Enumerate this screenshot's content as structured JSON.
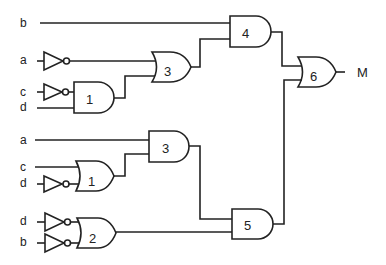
{
  "diagram": {
    "type": "logic-circuit",
    "inputs": [
      {
        "id": "in-b-top",
        "label": "b"
      },
      {
        "id": "in-a-top",
        "label": "a",
        "inverted": true
      },
      {
        "id": "in-c-top",
        "label": "c",
        "inverted": true
      },
      {
        "id": "in-d-top",
        "label": "d"
      },
      {
        "id": "in-a-bot",
        "label": "a"
      },
      {
        "id": "in-c-bot",
        "label": "c"
      },
      {
        "id": "in-d-mid",
        "label": "d",
        "inverted": true
      },
      {
        "id": "in-d-bot",
        "label": "d",
        "inverted": true
      },
      {
        "id": "in-b-bot",
        "label": "b",
        "inverted": true
      }
    ],
    "gates": [
      {
        "id": "and1-top",
        "type": "AND",
        "label": "1",
        "inputs": [
          "NOT c",
          "d"
        ]
      },
      {
        "id": "or3-top",
        "type": "OR",
        "label": "3",
        "inputs": [
          "NOT a",
          "and1-top"
        ]
      },
      {
        "id": "and4",
        "type": "AND",
        "label": "4",
        "inputs": [
          "b",
          "or3-top"
        ]
      },
      {
        "id": "or1-bot",
        "type": "OR",
        "label": "1",
        "inputs": [
          "c",
          "NOT d"
        ]
      },
      {
        "id": "and3-bot",
        "type": "AND",
        "label": "3",
        "inputs": [
          "a",
          "or1-bot"
        ]
      },
      {
        "id": "or2",
        "type": "OR",
        "label": "2",
        "inputs": [
          "NOT d",
          "NOT b"
        ]
      },
      {
        "id": "and5",
        "type": "AND",
        "label": "5",
        "inputs": [
          "and3-bot",
          "or2"
        ]
      },
      {
        "id": "or6",
        "type": "OR",
        "label": "6",
        "inputs": [
          "and4",
          "and5"
        ]
      }
    ],
    "output": {
      "label": "M"
    }
  }
}
